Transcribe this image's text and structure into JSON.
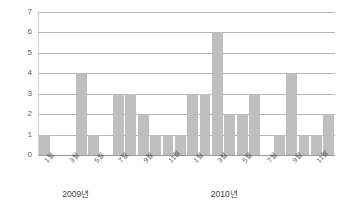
{
  "chart_data": {
    "type": "bar",
    "title": "",
    "xlabel": "",
    "ylabel": "",
    "ylim": [
      0,
      7
    ],
    "y_ticks": [
      0,
      1,
      2,
      3,
      4,
      5,
      6,
      7
    ],
    "grid": true,
    "legend": "none",
    "bar_color": "#bfbfbf",
    "gridline_color": "#b7b7b7",
    "categories": [
      "1월",
      "2월",
      "3월",
      "4월",
      "5월",
      "6월",
      "7월",
      "8월",
      "9월",
      "10월",
      "11월",
      "12월",
      "1월",
      "2월",
      "3월",
      "4월",
      "5월",
      "6월",
      "7월",
      "8월",
      "9월",
      "10월",
      "11월",
      "12월"
    ],
    "visible_tick_labels": [
      "1월",
      "3월",
      "5월",
      "7월",
      "9월",
      "11월",
      "1월",
      "3월",
      "5월",
      "7월",
      "9월",
      "11월"
    ],
    "visible_tick_indices": [
      0,
      2,
      4,
      6,
      8,
      10,
      12,
      14,
      16,
      18,
      20,
      22
    ],
    "values": [
      1,
      0,
      0,
      4,
      1,
      0,
      3,
      3,
      2,
      1,
      1,
      1,
      3,
      3,
      6,
      2,
      2,
      3,
      0,
      1,
      4,
      1,
      1,
      2
    ],
    "group_labels": [
      {
        "text": "2009년",
        "start_index": 0,
        "end_index": 11
      },
      {
        "text": "2010년",
        "start_index": 12,
        "end_index": 23
      }
    ]
  }
}
